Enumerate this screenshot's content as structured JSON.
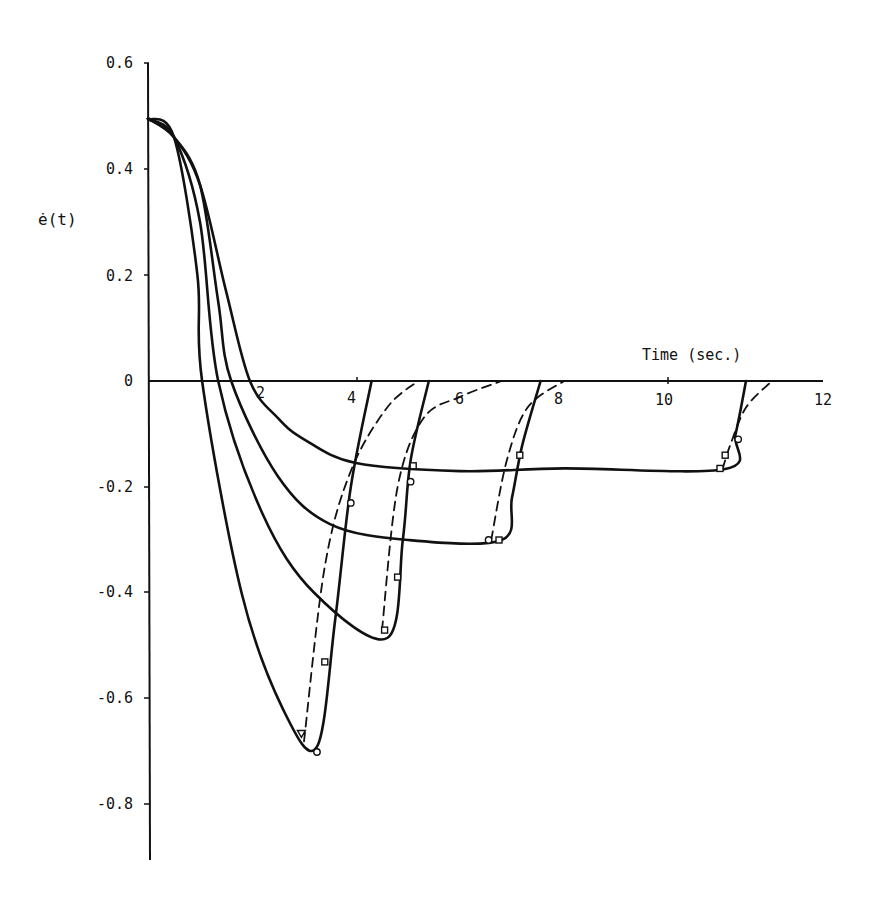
{
  "chart_data": {
    "type": "line",
    "title": "",
    "xlabel": "Time (sec.)",
    "ylabel": "ė(t)",
    "xlim": [
      0,
      12
    ],
    "ylim": [
      -0.9,
      0.6
    ],
    "grid": false,
    "legend": null,
    "x_ticks": [
      "2",
      "4",
      "6",
      "8",
      "10",
      "12"
    ],
    "y_ticks": [
      "0.6",
      "0.4",
      "0.2",
      "0",
      "-0.2",
      "-0.4",
      "-0.6",
      "-0.8"
    ],
    "series": [
      {
        "name": "curve-1",
        "style": "solid",
        "points": [
          [
            0,
            0.495
          ],
          [
            0.5,
            0.46
          ],
          [
            1.0,
            0.37
          ],
          [
            1.5,
            0.17
          ],
          [
            1.96,
            0
          ],
          [
            2.5,
            -0.07
          ],
          [
            3.0,
            -0.11
          ],
          [
            4.0,
            -0.155
          ],
          [
            6.0,
            -0.17
          ],
          [
            8.0,
            -0.165
          ],
          [
            11.1,
            -0.166
          ],
          [
            11.3,
            -0.1
          ],
          [
            11.5,
            0
          ]
        ]
      },
      {
        "name": "curve-1-dashed",
        "style": "dashed",
        "points": [
          [
            11.05,
            -0.166
          ],
          [
            11.2,
            -0.12
          ],
          [
            11.5,
            -0.05
          ],
          [
            12.0,
            0
          ]
        ]
      },
      {
        "name": "curve-2",
        "style": "solid",
        "points": [
          [
            0,
            0.495
          ],
          [
            0.5,
            0.46
          ],
          [
            1.0,
            0.37
          ],
          [
            1.35,
            0.15
          ],
          [
            1.6,
            0
          ],
          [
            2.5,
            -0.18
          ],
          [
            3.5,
            -0.27
          ],
          [
            5.0,
            -0.3
          ],
          [
            6.8,
            -0.3
          ],
          [
            7.0,
            -0.22
          ],
          [
            7.2,
            -0.12
          ],
          [
            7.55,
            0
          ]
        ]
      },
      {
        "name": "curve-2-dashed",
        "style": "dashed",
        "points": [
          [
            6.6,
            -0.3
          ],
          [
            6.9,
            -0.15
          ],
          [
            7.3,
            -0.05
          ],
          [
            8.0,
            0
          ]
        ]
      },
      {
        "name": "curve-3",
        "style": "solid",
        "points": [
          [
            0,
            0.495
          ],
          [
            0.5,
            0.46
          ],
          [
            1.0,
            0.3
          ],
          [
            1.35,
            0
          ],
          [
            2.2,
            -0.25
          ],
          [
            3.2,
            -0.4
          ],
          [
            4.6,
            -0.485
          ],
          [
            4.9,
            -0.3
          ],
          [
            5.05,
            -0.15
          ],
          [
            5.4,
            0
          ]
        ]
      },
      {
        "name": "curve-3-dashed",
        "style": "dashed",
        "points": [
          [
            4.5,
            -0.47
          ],
          [
            4.8,
            -0.2
          ],
          [
            5.3,
            -0.07
          ],
          [
            6.0,
            -0.03
          ],
          [
            6.8,
            0
          ]
        ]
      },
      {
        "name": "curve-4",
        "style": "solid",
        "points": [
          [
            0,
            0.495
          ],
          [
            0.5,
            0.46
          ],
          [
            0.95,
            0.2
          ],
          [
            1.04,
            0
          ],
          [
            1.8,
            -0.4
          ],
          [
            2.6,
            -0.62
          ],
          [
            3.25,
            -0.69
          ],
          [
            3.6,
            -0.45
          ],
          [
            3.9,
            -0.2
          ],
          [
            4.3,
            0
          ]
        ]
      },
      {
        "name": "curve-4-dashed",
        "style": "dashed",
        "points": [
          [
            3.0,
            -0.68
          ],
          [
            3.4,
            -0.35
          ],
          [
            3.9,
            -0.17
          ],
          [
            4.6,
            -0.05
          ],
          [
            5.2,
            0
          ]
        ]
      }
    ],
    "annotations": [
      "Time (sec.)",
      "ė(t)"
    ]
  }
}
